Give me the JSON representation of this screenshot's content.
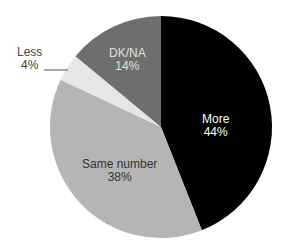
{
  "chart_data": {
    "type": "pie",
    "title": "",
    "slices": [
      {
        "label": "More",
        "value": 44,
        "display": "44%",
        "color": "#000000",
        "text_color": "#ffffff"
      },
      {
        "label": "Same number",
        "value": 38,
        "display": "38%",
        "color": "#b5b5b5",
        "text_color": "#333333"
      },
      {
        "label": "Less",
        "value": 4,
        "display": "4%",
        "color": "#e6e6e6",
        "text_color": "#333333"
      },
      {
        "label": "DK/NA",
        "value": 14,
        "display": "14%",
        "color": "#6e6e6e",
        "text_color": "#e0e0e0"
      }
    ],
    "start_angle_deg": 0,
    "direction": "clockwise",
    "legend": "none",
    "labels": "inside, except 'Less' outside with leader line"
  }
}
